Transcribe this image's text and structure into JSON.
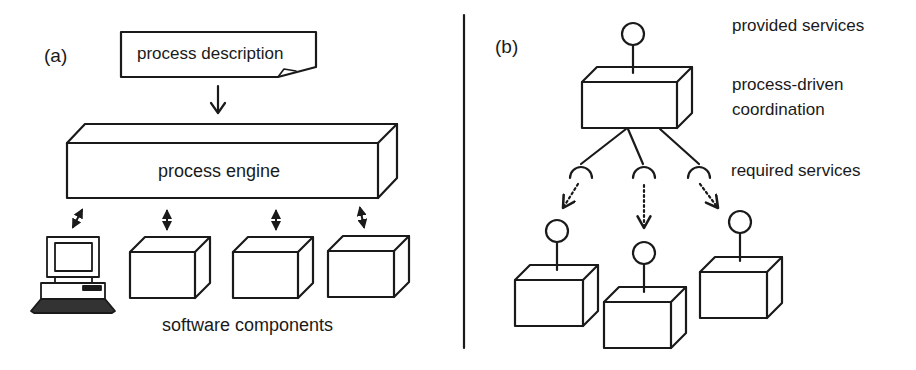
{
  "panel_a": {
    "label": "(a)",
    "process_description": "process description",
    "process_engine": "process engine",
    "software_components": "software components",
    "components_count": 3,
    "client_icon": "desktop-computer-icon"
  },
  "panel_b": {
    "label": "(b)",
    "provided_services": "provided services",
    "coordination_line1": "process-driven",
    "coordination_line2": "coordination",
    "required_services": "required services",
    "component_count": 3
  },
  "colors": {
    "stroke": "#1a1a1a",
    "background": "#ffffff"
  }
}
